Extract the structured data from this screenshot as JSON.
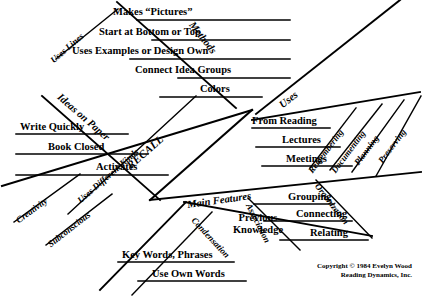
{
  "diagram": {
    "title": "RECALL",
    "type": "fishbone",
    "spine_label": "RECALL",
    "branches": [
      {
        "id": "methods",
        "label": "Methods",
        "items": [
          "Makes “Pictures”",
          "Start at Bottom or Top",
          "Uses Examples or Design Own",
          "Connect Idea Groups",
          "Colors"
        ],
        "sub_branches": [
          {
            "label": "Uses Lines"
          }
        ]
      },
      {
        "id": "ideas-on-paper",
        "label": "Ideas on Paper",
        "items": [
          "Write Quickly",
          "Book Closed",
          "Activates"
        ],
        "sub_branches": [
          {
            "label": "Creativity"
          },
          {
            "label": "Subconscious"
          }
        ]
      },
      {
        "id": "uses",
        "label": "Uses",
        "items": [
          "From Reading",
          "Lectures",
          "Meetings"
        ],
        "sub_branches": [
          {
            "label": "Remembering"
          },
          {
            "label": "Documenting"
          },
          {
            "label": "Planning"
          },
          {
            "label": "Preserving"
          }
        ]
      },
      {
        "id": "main-features",
        "label": "Main Features",
        "items": [
          "Previous Knowledge",
          "Grouping",
          "Connecting",
          "Relating"
        ],
        "sub_branches": [
          {
            "label": "Condensation"
          },
          {
            "label": "Association"
          },
          {
            "label": "Organization"
          }
        ],
        "extra_items": [
          "Key Words, Phrases",
          "Use Own Words"
        ]
      }
    ],
    "mid_label": "Uses Different Kinds"
  },
  "credit": {
    "line1": "Copyright © 1984 Evelyn Wood",
    "line2": "Reading Dynamics, Inc."
  },
  "colors": {
    "ink": "#000000",
    "paper": "#ffffff"
  }
}
